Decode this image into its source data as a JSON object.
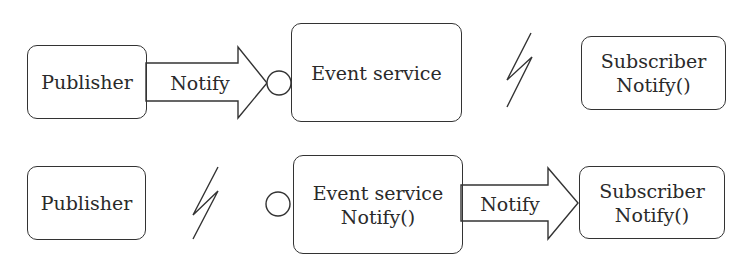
{
  "diagram": {
    "rows": [
      {
        "publisher": {
          "label": "Publisher"
        },
        "arrow": {
          "label": "Notify",
          "from": "publisher",
          "to": "event-service"
        },
        "event_service": {
          "lines": [
            "Event service"
          ]
        },
        "broken_link": {
          "between": "event-service",
          "and": "subscriber"
        },
        "subscriber": {
          "lines": [
            "Subscriber",
            "Notify()"
          ]
        }
      },
      {
        "publisher": {
          "label": "Publisher"
        },
        "broken_link": {
          "between": "publisher",
          "and": "event-service"
        },
        "event_service": {
          "lines": [
            "Event service",
            "Notify()"
          ]
        },
        "arrow": {
          "label": "Notify",
          "from": "event-service",
          "to": "subscriber"
        },
        "subscriber": {
          "lines": [
            "Subscriber",
            "Notify()"
          ]
        }
      }
    ],
    "colors": {
      "stroke": "#333333",
      "text": "#2a2a2a",
      "background": "#ffffff"
    }
  }
}
